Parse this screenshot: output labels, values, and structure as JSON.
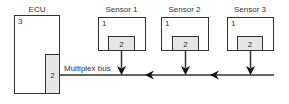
{
  "ecu": {
    "title": "ECU",
    "label": "3",
    "port_label": "2"
  },
  "bus": {
    "label": "Multiplex bus"
  },
  "sensors": [
    {
      "title": "Sensor 1",
      "label": "1",
      "port_label": "2"
    },
    {
      "title": "Sensor 2",
      "label": "1",
      "port_label": "2"
    },
    {
      "title": "Sensor 3",
      "label": "1",
      "port_label": "2"
    }
  ],
  "colors": {
    "stroke": "#333333",
    "port_fill": "#e6e6e6",
    "text": "#333333"
  }
}
